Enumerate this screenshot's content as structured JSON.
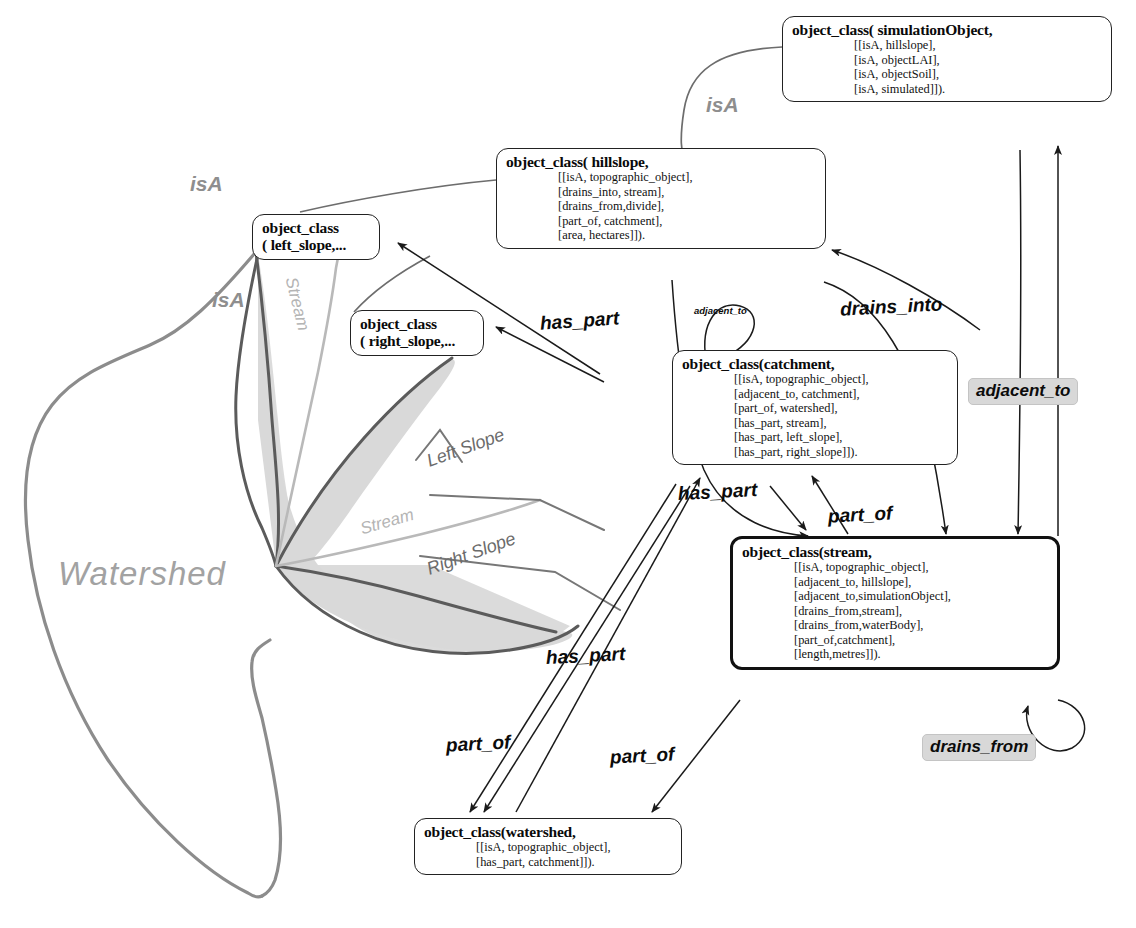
{
  "figure": {
    "kind": "ontology-diagram",
    "title_text": "",
    "colors": {
      "node_border": "#222222",
      "node_border_strong": "#111111",
      "relation_label": "#0b0b0b",
      "relation_badge_bg": "#d8d8d8",
      "isa_label": "#8e8e8e",
      "map_outline": "#8c8c8c",
      "map_fill": "#d6d6d6",
      "map_text": "#9a9a9a"
    }
  },
  "nodes": {
    "simulation_object": {
      "head": "object_class( simulationObject,",
      "lines": [
        "[[isA, hillslope],",
        "[isA, objectLAI],",
        "[isA, objectSoil],",
        "[isA, simulated]])."
      ]
    },
    "hillslope": {
      "head": "object_class( hillslope,",
      "lines": [
        "[[isA, topographic_object],",
        "[drains_into, stream],",
        "[drains_from,divide],",
        "[part_of, catchment],",
        "[area, hectares]])."
      ]
    },
    "left_slope": {
      "head": "object_class",
      "lines": [
        "( left_slope,..."
      ]
    },
    "right_slope": {
      "head": "object_class",
      "lines": [
        "( right_slope,..."
      ]
    },
    "catchment": {
      "head": "object_class(catchment,",
      "lines": [
        "[[isA, topographic_object],",
        "[adjacent_to, catchment],",
        "[part_of, watershed],",
        "[has_part, stream],",
        "[has_part, left_slope],",
        "[has_part, right_slope]])."
      ]
    },
    "stream": {
      "head": "object_class(stream,",
      "lines": [
        "[[isA, topographic_object],",
        "[adjacent_to, hillslope],",
        "[adjacent_to,simulationObject],",
        "[drains_from,stream],",
        "[drains_from,waterBody],",
        "[part_of,catchment],",
        "[length,metres]])."
      ]
    },
    "watershed": {
      "head": "object_class(watershed,",
      "lines": [
        "[[isA, topographic_object],",
        "[has_part, catchment]])."
      ]
    }
  },
  "relations": {
    "isa_simulation_hillslope": "isA",
    "isa_hillslope_leftslope": "isA",
    "isa_hillslope_rightslope": "isA",
    "has_part_catchment_leftslope": "has_part",
    "adjacent_to_catchment_self": "adjacent_to",
    "drains_into_hillslope_stream": "drains_into",
    "adjacent_to_stream_simulation": "adjacent_to",
    "has_part_catchment_stream": "has_part",
    "part_of_stream_catchment": "part_of",
    "has_part_watershed_catchment": "has_part",
    "part_of_catchment_watershed": "part_of",
    "part_of_stream_watershed": "part_of",
    "drains_from_stream_self": "drains_from"
  },
  "map": {
    "watershed_label": "Watershed",
    "stream_label_upper": "Stream",
    "stream_label_lower": "Stream",
    "left_slope_label": "Left Slope",
    "right_slope_label": "Right Slope"
  }
}
